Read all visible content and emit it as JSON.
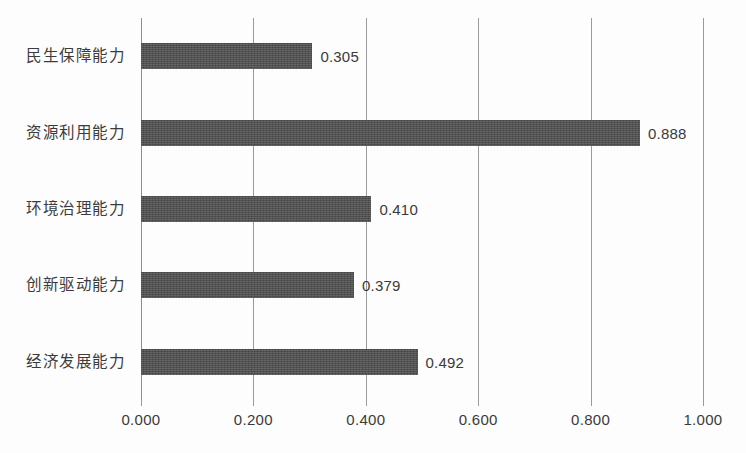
{
  "chart_data": {
    "type": "bar",
    "orientation": "horizontal",
    "title": "",
    "subtitle": "",
    "xlabel": "",
    "ylabel": "",
    "xlim": [
      0.0,
      1.0
    ],
    "grid": true,
    "legend": false,
    "categories": [
      "经济发展能力",
      "创新驱动能力",
      "环境治理能力",
      "资源利用能力",
      "民生保障能力"
    ],
    "values": [
      0.492,
      0.379,
      0.41,
      0.888,
      0.305
    ],
    "value_labels": [
      "0.492",
      "0.379",
      "0.410",
      "0.888",
      "0.305"
    ],
    "xticks": [
      0.0,
      0.2,
      0.4,
      0.6,
      0.8,
      1.0
    ],
    "xticklabels": [
      "0.000",
      "0.200",
      "0.400",
      "0.600",
      "0.800",
      "1.000"
    ],
    "bar_color": "#4d4d4d",
    "grid_color": "#9a9a9a",
    "text_color": "#3a3a3a",
    "background_color": "#ffffff"
  },
  "bars": [
    {
      "label": "民生保障能力",
      "value": 0.305,
      "value_label": "0.305"
    },
    {
      "label": "资源利用能力",
      "value": 0.888,
      "value_label": "0.888"
    },
    {
      "label": "环境治理能力",
      "value": 0.41,
      "value_label": "0.410"
    },
    {
      "label": "创新驱动能力",
      "value": 0.379,
      "value_label": "0.379"
    },
    {
      "label": "经济发展能力",
      "value": 0.492,
      "value_label": "0.492"
    }
  ],
  "xticks": [
    {
      "value": 0.0,
      "label": "0.000"
    },
    {
      "value": 0.2,
      "label": "0.200"
    },
    {
      "value": 0.4,
      "label": "0.400"
    },
    {
      "value": 0.6,
      "label": "0.600"
    },
    {
      "value": 0.8,
      "label": "0.800"
    },
    {
      "value": 1.0,
      "label": "1.000"
    }
  ]
}
